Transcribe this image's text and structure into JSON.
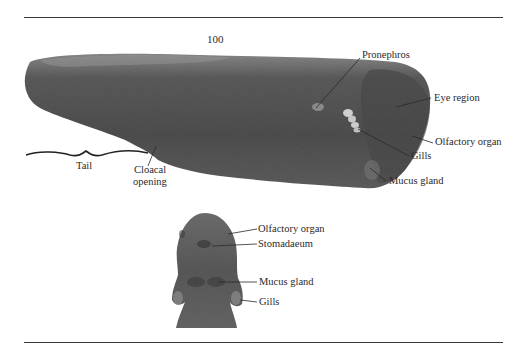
{
  "figure": {
    "plate_number": "100",
    "lateral_view": {
      "labels": {
        "pronephros": "Pronephros",
        "eye_region": "Eye region",
        "olfactory_organ": "Olfactory organ",
        "gills": "Gills",
        "mucus_gland": "Mucus gland",
        "tail": "Tail",
        "cloacal_line1": "Cloacal",
        "cloacal_line2": "opening"
      }
    },
    "ventral_view": {
      "labels": {
        "olfactory_organ": "Olfactory organ",
        "stomadaeum": "Stomadaeum",
        "mucus_gland": "Mucus gland",
        "gills": "Gills"
      }
    },
    "colors": {
      "specimen_dark": "#4a4a4a",
      "specimen_mid": "#6a6a6a",
      "specimen_light": "#9a9a9a",
      "rule": "#3a3a3a",
      "text": "#2b2b2b"
    }
  }
}
